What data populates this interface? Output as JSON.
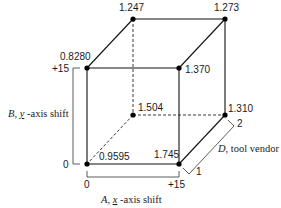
{
  "diagram": {
    "type": "cube-plot",
    "vertices": [
      {
        "id": "front-bottom-left",
        "label": "0.9595",
        "A": "0",
        "B": "0",
        "D": "1"
      },
      {
        "id": "front-bottom-right",
        "label": "1.745",
        "A": "+15",
        "B": "0",
        "D": "1"
      },
      {
        "id": "front-top-left",
        "label": "0.8280",
        "A": "0",
        "B": "+15",
        "D": "1"
      },
      {
        "id": "front-top-right",
        "label": "1.370",
        "A": "+15",
        "B": "+15",
        "D": "1"
      },
      {
        "id": "back-bottom-left",
        "label": "1.504",
        "A": "0",
        "B": "0",
        "D": "2"
      },
      {
        "id": "back-bottom-right",
        "label": "1.310",
        "A": "+15",
        "B": "0",
        "D": "2"
      },
      {
        "id": "back-top-left",
        "label": "1.247",
        "A": "0",
        "B": "+15",
        "D": "2"
      },
      {
        "id": "back-top-right",
        "label": "1.273",
        "A": "+15",
        "B": "+15",
        "D": "2"
      }
    ],
    "axes": {
      "x": {
        "factor": "A",
        "name": "x",
        "suffix": "-axis shift",
        "low": "0",
        "high": "+15"
      },
      "y": {
        "factor": "B",
        "name": "y",
        "suffix": "-axis shift",
        "low": "0",
        "high": "+15"
      },
      "z": {
        "factor": "D",
        "name": "tool vendor",
        "low": "1",
        "high": "2"
      }
    }
  }
}
